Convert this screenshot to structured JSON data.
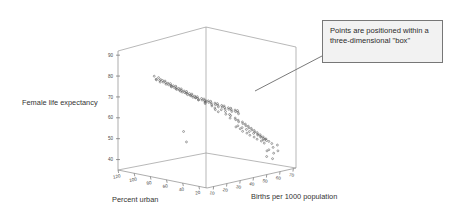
{
  "figure": {
    "background_color": "#ffffff",
    "axis_color": "#8a8a8a",
    "point_color": "#5a5a5a",
    "callout_bg": "#f2f2f2",
    "callout_border": "#777777"
  },
  "callout": {
    "name": "annotation-callout",
    "text": "Points are positioned within a three-dimensional \"box\""
  },
  "chart_data": {
    "type": "scatter",
    "projection": "3d",
    "title": "",
    "xlabel": "Percent urban",
    "ylabel": "Female life expectancy",
    "zlabel": "Births per 1000 population",
    "xticks": [
      120,
      100,
      80,
      60,
      40,
      20
    ],
    "yticks": [
      90,
      80,
      70,
      60,
      50,
      40
    ],
    "zticks": [
      10,
      20,
      30,
      40,
      50,
      60,
      70
    ],
    "xlim": [
      120,
      10
    ],
    "ylim": [
      35,
      92
    ],
    "zlim": [
      5,
      72
    ],
    "grid": false,
    "legend": false,
    "series": [
      {
        "name": "countries",
        "points": [
          [
            90,
            81,
            14
          ],
          [
            86,
            80,
            13
          ],
          [
            84,
            80,
            12
          ],
          [
            83,
            81,
            13
          ],
          [
            82,
            80,
            14
          ],
          [
            81,
            79,
            13
          ],
          [
            80,
            80,
            12
          ],
          [
            79,
            79,
            14
          ],
          [
            78,
            80,
            13
          ],
          [
            77,
            78,
            15
          ],
          [
            76,
            79,
            14
          ],
          [
            75,
            80,
            13
          ],
          [
            74,
            78,
            15
          ],
          [
            73,
            79,
            14
          ],
          [
            72,
            77,
            16
          ],
          [
            71,
            78,
            15
          ],
          [
            70,
            79,
            14
          ],
          [
            69,
            77,
            16
          ],
          [
            68,
            78,
            15
          ],
          [
            67,
            76,
            17
          ],
          [
            66,
            77,
            16
          ],
          [
            65,
            78,
            15
          ],
          [
            64,
            76,
            17
          ],
          [
            63,
            77,
            16
          ],
          [
            62,
            75,
            18
          ],
          [
            61,
            76,
            17
          ],
          [
            60,
            77,
            16
          ],
          [
            59,
            75,
            18
          ],
          [
            58,
            76,
            17
          ],
          [
            57,
            74,
            19
          ],
          [
            56,
            75,
            18
          ],
          [
            55,
            76,
            17
          ],
          [
            54,
            74,
            19
          ],
          [
            53,
            75,
            18
          ],
          [
            52,
            73,
            20
          ],
          [
            51,
            74,
            19
          ],
          [
            50,
            75,
            18
          ],
          [
            49,
            73,
            20
          ],
          [
            48,
            74,
            19
          ],
          [
            47,
            72,
            21
          ],
          [
            46,
            73,
            20
          ],
          [
            45,
            74,
            19
          ],
          [
            44,
            72,
            22
          ],
          [
            43,
            73,
            21
          ],
          [
            42,
            71,
            23
          ],
          [
            41,
            72,
            22
          ],
          [
            40,
            73,
            21
          ],
          [
            39,
            71,
            24
          ],
          [
            38,
            72,
            23
          ],
          [
            37,
            70,
            25
          ],
          [
            36,
            71,
            24
          ],
          [
            35,
            72,
            23
          ],
          [
            34,
            70,
            26
          ],
          [
            33,
            71,
            25
          ],
          [
            32,
            69,
            27
          ],
          [
            31,
            70,
            26
          ],
          [
            30,
            71,
            25
          ],
          [
            29,
            69,
            28
          ],
          [
            28,
            70,
            27
          ],
          [
            27,
            68,
            29
          ],
          [
            26,
            69,
            28
          ],
          [
            25,
            70,
            27
          ],
          [
            24,
            68,
            30
          ],
          [
            23,
            69,
            29
          ],
          [
            22,
            67,
            31
          ],
          [
            21,
            68,
            30
          ],
          [
            20,
            69,
            29
          ],
          [
            19,
            67,
            32
          ],
          [
            18,
            68,
            31
          ],
          [
            17,
            66,
            33
          ],
          [
            16,
            67,
            32
          ],
          [
            15,
            68,
            31
          ],
          [
            40,
            66,
            34
          ],
          [
            38,
            65,
            36
          ],
          [
            36,
            64,
            35
          ],
          [
            35,
            63,
            38
          ],
          [
            34,
            62,
            37
          ],
          [
            33,
            64,
            36
          ],
          [
            32,
            61,
            40
          ],
          [
            31,
            62,
            39
          ],
          [
            30,
            60,
            41
          ],
          [
            29,
            61,
            40
          ],
          [
            28,
            59,
            43
          ],
          [
            27,
            60,
            42
          ],
          [
            26,
            58,
            44
          ],
          [
            25,
            59,
            43
          ],
          [
            24,
            57,
            45
          ],
          [
            23,
            58,
            44
          ],
          [
            22,
            56,
            46
          ],
          [
            21,
            57,
            45
          ],
          [
            20,
            55,
            47
          ],
          [
            19,
            56,
            46
          ],
          [
            18,
            54,
            48
          ],
          [
            17,
            55,
            47
          ],
          [
            16,
            53,
            49
          ],
          [
            15,
            54,
            48
          ],
          [
            14,
            52,
            50
          ],
          [
            13,
            53,
            49
          ],
          [
            12,
            51,
            51
          ],
          [
            11,
            52,
            50
          ],
          [
            30,
            55,
            44
          ],
          [
            28,
            54,
            46
          ],
          [
            26,
            53,
            47
          ],
          [
            24,
            52,
            49
          ],
          [
            22,
            51,
            50
          ],
          [
            20,
            50,
            52
          ],
          [
            18,
            49,
            53
          ],
          [
            16,
            51,
            51
          ],
          [
            14,
            50,
            54
          ],
          [
            12,
            49,
            55
          ],
          [
            35,
            57,
            42
          ],
          [
            33,
            56,
            44
          ],
          [
            31,
            58,
            41
          ],
          [
            29,
            57,
            43
          ],
          [
            27,
            56,
            45
          ],
          [
            25,
            55,
            46
          ],
          [
            23,
            54,
            48
          ],
          [
            21,
            53,
            50
          ],
          [
            19,
            52,
            51
          ],
          [
            17,
            51,
            53
          ],
          [
            45,
            68,
            30
          ],
          [
            44,
            66,
            32
          ],
          [
            43,
            67,
            31
          ],
          [
            42,
            65,
            33
          ],
          [
            80,
            53,
            30
          ],
          [
            60,
            51,
            20
          ],
          [
            20,
            42,
            56
          ],
          [
            16,
            41,
            58
          ],
          [
            14,
            46,
            54
          ],
          [
            12,
            47,
            56
          ],
          [
            10,
            48,
            58
          ],
          [
            18,
            45,
            55
          ],
          [
            13,
            44,
            57
          ],
          [
            11,
            45,
            59
          ],
          [
            50,
            69,
            28
          ],
          [
            48,
            70,
            27
          ],
          [
            46,
            71,
            26
          ],
          [
            55,
            72,
            24
          ],
          [
            53,
            71,
            25
          ],
          [
            58,
            73,
            22
          ],
          [
            62,
            74,
            21
          ],
          [
            66,
            75,
            19
          ],
          [
            70,
            76,
            18
          ],
          [
            74,
            77,
            17
          ]
        ]
      }
    ]
  }
}
